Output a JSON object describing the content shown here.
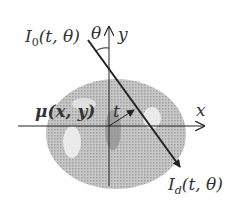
{
  "diagram": {
    "labels": {
      "source": "I₀(t, θ)",
      "source_main": "I",
      "source_sub": "0",
      "source_args": "(t, θ)",
      "theta": "θ",
      "y_axis": "y",
      "x_axis": "x",
      "mu": "μ(x, y)",
      "t": "t",
      "detector": "I_d(t, θ)",
      "detector_main": "I",
      "detector_sub": "d",
      "detector_args": "(t, θ)"
    },
    "colors": {
      "object_fill": "#bdbdbd",
      "object_dark": "#9a9a9a",
      "object_light": "#f2f2f2",
      "lines": "#222222",
      "text": "#333333"
    }
  }
}
